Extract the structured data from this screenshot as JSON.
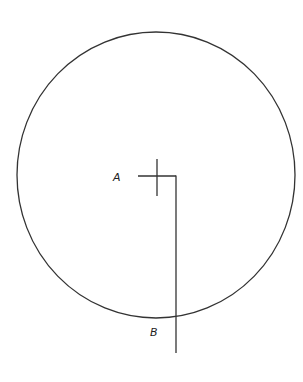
{
  "diagram": {
    "background": "#ffffff",
    "line_color": "#333333",
    "circle": {
      "cx": 156,
      "cy": 175,
      "rx": 139,
      "ry": 143
    },
    "crosshair": {
      "center": [
        157,
        176
      ],
      "vertical": {
        "x": 157,
        "y1": 159,
        "y2": 196
      },
      "horizontal": {
        "y": 176,
        "x1": 138,
        "x2": 176
      }
    },
    "drop_line": {
      "x": 176,
      "y1": 176,
      "y2": 353
    },
    "labels": [
      {
        "id": "A",
        "text": "A",
        "x": 113,
        "y": 181
      },
      {
        "id": "B",
        "text": "B",
        "x": 150,
        "y": 336
      }
    ]
  }
}
